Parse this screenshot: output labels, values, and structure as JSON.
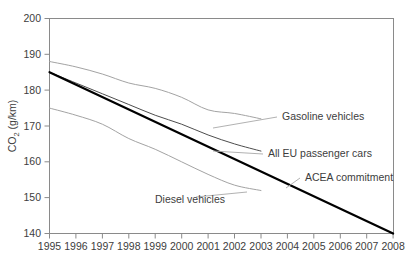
{
  "chart_data": {
    "type": "line",
    "title": "",
    "xlabel": "",
    "ylabel": "CO2 (g/km)",
    "ylabel_base": "CO",
    "ylabel_sub": "2",
    "ylabel_units": " (g/km)",
    "xlim": [
      1995,
      2008
    ],
    "ylim": [
      140,
      200
    ],
    "grid": false,
    "legend": "inline-annotations",
    "x_ticks": [
      "1995",
      "1996",
      "1997",
      "1998",
      "1999",
      "2000",
      "2001",
      "2002",
      "2003",
      "2004",
      "2005",
      "2006",
      "2007",
      "2008"
    ],
    "y_ticks": [
      "140",
      "150",
      "160",
      "170",
      "180",
      "190",
      "200"
    ],
    "series": [
      {
        "name": "ACEA commitment",
        "style": "thick-black-straight",
        "color": "#000000",
        "x": [
          1995,
          2008
        ],
        "values": [
          185,
          140
        ]
      },
      {
        "name": "All EU passenger cars",
        "style": "thin-grey",
        "color": "#555555",
        "x": [
          1995,
          1996,
          1997,
          1998,
          1999,
          2000,
          2001,
          2002,
          2003
        ],
        "values": [
          185.0,
          182.0,
          179.0,
          176.0,
          173.0,
          170.5,
          167.5,
          165.0,
          163.0
        ]
      },
      {
        "name": "Gasoline vehicles",
        "style": "light-grey",
        "color": "#9a9a9a",
        "x": [
          1995,
          1996,
          1997,
          1998,
          1999,
          2000,
          2001,
          2002,
          2003
        ],
        "values": [
          188.0,
          186.5,
          184.5,
          182.0,
          180.5,
          178.0,
          174.5,
          173.5,
          172.0
        ]
      },
      {
        "name": "Diesel vehicles",
        "style": "light-grey",
        "color": "#9a9a9a",
        "x": [
          1995,
          1996,
          1997,
          1998,
          1999,
          2000,
          2001,
          2002,
          2003
        ],
        "values": [
          175.0,
          173.0,
          170.5,
          166.5,
          163.5,
          160.0,
          156.5,
          153.5,
          152.0
        ]
      }
    ],
    "annotations": [
      {
        "text": "Gasoline vehicles",
        "x": 282,
        "y": 120
      },
      {
        "text": "All EU passenger cars",
        "x": 268,
        "y": 157
      },
      {
        "text": "ACEA commitment",
        "x": 305,
        "y": 181
      },
      {
        "text": "Diesel vehicles",
        "x": 155,
        "y": 203
      }
    ]
  }
}
